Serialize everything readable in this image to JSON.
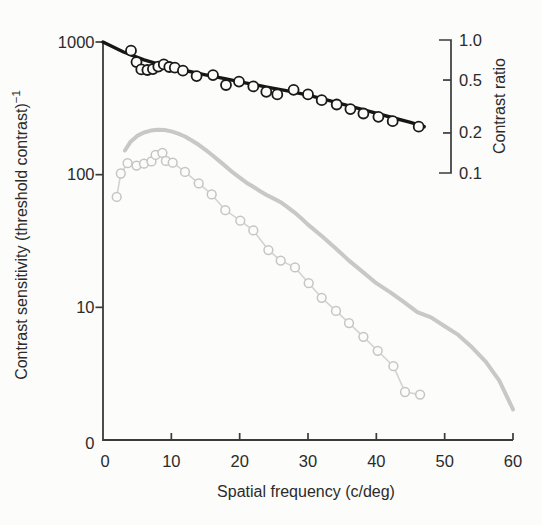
{
  "figure": {
    "background": "#fcfcfa"
  },
  "chart_data": {
    "type": "line",
    "title": "",
    "xlabel": "Spatial frequency (c/deg)",
    "ylabel": "Contrast sensitivity (threshold contrast)",
    "ylabel_exponent": "−1",
    "y2label": "Contrast ratio",
    "x_axis": {
      "range": [
        0,
        60
      ],
      "tick_values": [
        0,
        10,
        20,
        30,
        40,
        50,
        60
      ],
      "scale": "linear"
    },
    "y_axis": {
      "range_log": [
        1,
        1000
      ],
      "scale": "log",
      "ticks": [
        {
          "label": "1000",
          "value": 1000
        },
        {
          "label": "100",
          "value": 100
        },
        {
          "label": "10",
          "value": 10
        },
        {
          "label": "0",
          "value": 1
        }
      ]
    },
    "y2_axis": {
      "range_log": [
        0.1,
        1.0
      ],
      "scale": "log",
      "ticks": [
        {
          "label": "1.0",
          "value": 1.0
        },
        {
          "label": "0.5",
          "value": 0.5
        },
        {
          "label": "0.2",
          "value": 0.2
        },
        {
          "label": "0.1",
          "value": 0.1
        }
      ]
    },
    "grid": false,
    "legend": "none",
    "colors": {
      "black_line": "#161616",
      "black_marker_stroke": "#1a1a1a",
      "gray_curve": "#c8c8c8",
      "gray_data_line": "#d3d3d3",
      "gray_marker_stroke": "#c5c5c5",
      "marker_fill": "#fcfcfa",
      "axis": "#3a3a3a",
      "text": "#2b2b2b"
    },
    "series": [
      {
        "id": "gray-smooth-curve",
        "kind": "line",
        "color": "#c8c8c8",
        "width": 4,
        "points": [
          [
            3.2,
            152
          ],
          [
            4,
            176
          ],
          [
            5,
            196
          ],
          [
            6,
            208
          ],
          [
            7,
            215
          ],
          [
            8,
            218
          ],
          [
            9,
            217
          ],
          [
            10,
            212
          ],
          [
            11,
            204
          ],
          [
            12,
            194
          ],
          [
            13,
            181
          ],
          [
            14,
            168
          ],
          [
            15,
            154
          ],
          [
            16,
            140
          ],
          [
            17,
            127
          ],
          [
            18,
            115
          ],
          [
            19,
            104
          ],
          [
            20,
            95
          ],
          [
            21,
            87
          ],
          [
            22,
            81
          ],
          [
            23,
            75
          ],
          [
            24,
            70
          ],
          [
            25,
            66
          ],
          [
            26,
            62
          ],
          [
            27,
            57
          ],
          [
            28,
            52
          ],
          [
            29,
            47
          ],
          [
            30,
            42
          ],
          [
            32,
            34.5
          ],
          [
            34,
            28
          ],
          [
            36,
            22.5
          ],
          [
            38,
            18.5
          ],
          [
            40,
            15.2
          ],
          [
            42,
            13
          ],
          [
            44,
            11
          ],
          [
            46,
            9.2
          ],
          [
            48,
            8.4
          ],
          [
            50,
            7.2
          ],
          [
            52,
            6.2
          ],
          [
            54,
            5.0
          ],
          [
            56,
            3.9
          ],
          [
            58,
            2.8
          ],
          [
            60,
            1.7
          ]
        ]
      },
      {
        "id": "gray-data-points",
        "kind": "scatter-line",
        "marker": "open-circle",
        "marker_radius": 4.4,
        "line_color": "#d3d3d3",
        "color": "#c5c5c5",
        "points": [
          [
            2.0,
            68
          ],
          [
            2.6,
            102
          ],
          [
            3.6,
            122
          ],
          [
            4.9,
            117
          ],
          [
            6.0,
            121
          ],
          [
            7.1,
            126
          ],
          [
            7.7,
            141
          ],
          [
            8.7,
            146
          ],
          [
            9.2,
            127
          ],
          [
            10.2,
            123
          ],
          [
            12.0,
            105
          ],
          [
            14.0,
            86
          ],
          [
            15.9,
            71
          ],
          [
            17.9,
            54
          ],
          [
            20.1,
            45
          ],
          [
            22.0,
            38
          ],
          [
            24.2,
            27
          ],
          [
            26.0,
            22.5
          ],
          [
            28.1,
            20
          ],
          [
            30.1,
            15.2
          ],
          [
            32.0,
            11.8
          ],
          [
            34.1,
            9.4
          ],
          [
            36.0,
            7.6
          ],
          [
            38.1,
            6.0
          ],
          [
            40.2,
            4.7
          ],
          [
            42.5,
            3.6
          ],
          [
            44.2,
            2.3
          ],
          [
            46.4,
            2.2
          ]
        ]
      },
      {
        "id": "black-fit-line",
        "kind": "line",
        "color": "#161616",
        "width": 3.4,
        "points": [
          [
            0,
            1000
          ],
          [
            3,
            840
          ],
          [
            6,
            733
          ],
          [
            9,
            662
          ],
          [
            12,
            610
          ],
          [
            15,
            565
          ],
          [
            18,
            527
          ],
          [
            21,
            490
          ],
          [
            24,
            456
          ],
          [
            27,
            428
          ],
          [
            30,
            398
          ],
          [
            33,
            363
          ],
          [
            36,
            330
          ],
          [
            39,
            300
          ],
          [
            42,
            272
          ],
          [
            45,
            248
          ],
          [
            47,
            230
          ]
        ]
      },
      {
        "id": "black-data-points",
        "kind": "scatter",
        "marker": "open-circle",
        "marker_radius": 5,
        "color": "#1a1a1a",
        "points": [
          [
            4.1,
            860
          ],
          [
            4.9,
            705
          ],
          [
            5.6,
            622
          ],
          [
            6.5,
            615
          ],
          [
            7.3,
            625
          ],
          [
            8.1,
            652
          ],
          [
            8.9,
            678
          ],
          [
            9.7,
            648
          ],
          [
            10.5,
            640
          ],
          [
            11.7,
            608
          ],
          [
            13.7,
            553
          ],
          [
            16.1,
            563
          ],
          [
            18.0,
            474
          ],
          [
            19.9,
            503
          ],
          [
            22.0,
            463
          ],
          [
            23.9,
            421
          ],
          [
            25.5,
            403
          ],
          [
            27.9,
            436
          ],
          [
            30.0,
            403
          ],
          [
            32.0,
            364
          ],
          [
            34.2,
            338
          ],
          [
            36.2,
            312
          ],
          [
            38.1,
            289
          ],
          [
            40.3,
            273
          ],
          [
            42.4,
            253
          ],
          [
            46.2,
            230
          ]
        ]
      }
    ]
  }
}
